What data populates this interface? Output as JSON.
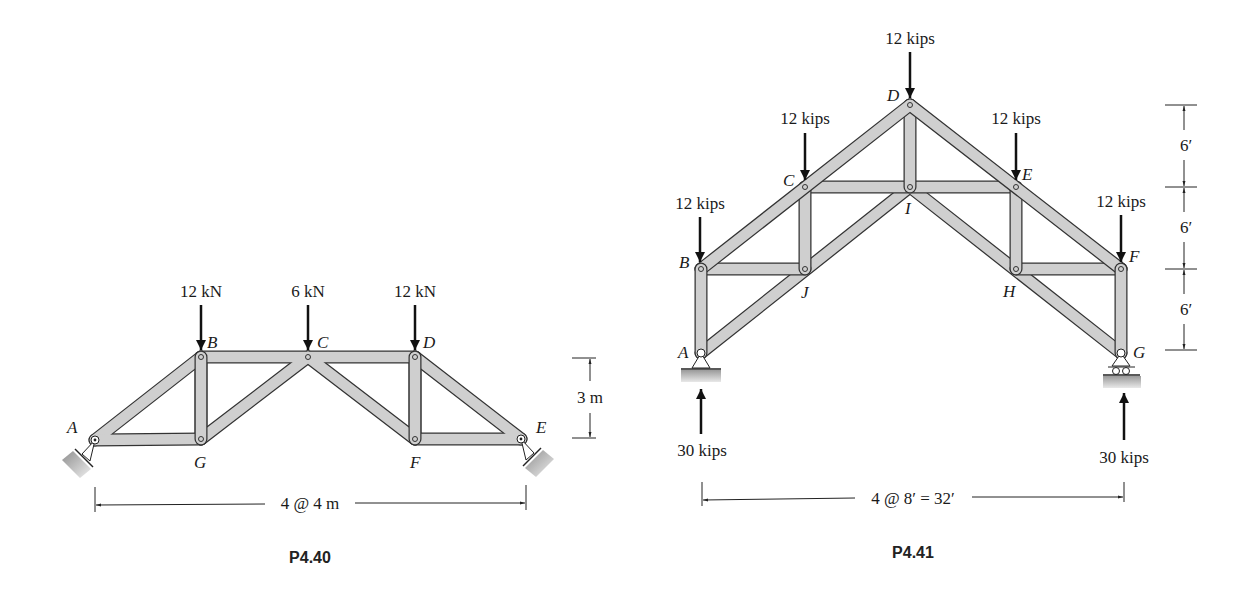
{
  "figures": [
    {
      "id": "p4-40",
      "caption": "P4.40",
      "nodes": {
        "A": {
          "label": "A",
          "x": 95,
          "y": 440
        },
        "G": {
          "label": "G",
          "x": 201,
          "y": 439
        },
        "B": {
          "label": "B",
          "x": 201,
          "y": 357
        },
        "C": {
          "label": "C",
          "x": 308,
          "y": 357
        },
        "D": {
          "label": "D",
          "x": 415,
          "y": 357
        },
        "F": {
          "label": "F",
          "x": 415,
          "y": 439
        },
        "E": {
          "label": "E",
          "x": 521,
          "y": 439
        }
      },
      "members": [
        [
          "A",
          "B"
        ],
        [
          "A",
          "G"
        ],
        [
          "G",
          "B"
        ],
        [
          "B",
          "C"
        ],
        [
          "G",
          "C"
        ],
        [
          "C",
          "D"
        ],
        [
          "C",
          "F"
        ],
        [
          "D",
          "F"
        ],
        [
          "F",
          "E"
        ],
        [
          "D",
          "E"
        ]
      ],
      "loads": [
        {
          "node": "B",
          "label": "12 kN"
        },
        {
          "node": "C",
          "label": "6 kN"
        },
        {
          "node": "D",
          "label": "12 kN"
        }
      ],
      "dimensions": {
        "height": "3 m",
        "span": "4 @ 4 m"
      },
      "supports": {
        "A": "pin",
        "E": "pin"
      }
    },
    {
      "id": "p4-41",
      "caption": "P4.41",
      "nodes": {
        "A": {
          "label": "A",
          "x": 701,
          "y": 353
        },
        "B": {
          "label": "B",
          "x": 701,
          "y": 269
        },
        "C": {
          "label": "C",
          "x": 805,
          "y": 187
        },
        "D": {
          "label": "D",
          "x": 910,
          "y": 105
        },
        "E": {
          "label": "E",
          "x": 1016,
          "y": 187
        },
        "F": {
          "label": "F",
          "x": 1121,
          "y": 269
        },
        "G": {
          "label": "G",
          "x": 1121,
          "y": 353
        },
        "I": {
          "label": "I",
          "x": 910,
          "y": 187
        },
        "J": {
          "label": "J",
          "x": 805,
          "y": 269
        },
        "H": {
          "label": "H",
          "x": 1016,
          "y": 269
        }
      },
      "members": [
        [
          "A",
          "B"
        ],
        [
          "B",
          "C"
        ],
        [
          "C",
          "D"
        ],
        [
          "D",
          "E"
        ],
        [
          "E",
          "F"
        ],
        [
          "F",
          "G"
        ],
        [
          "A",
          "J"
        ],
        [
          "J",
          "I"
        ],
        [
          "I",
          "H"
        ],
        [
          "H",
          "G"
        ],
        [
          "B",
          "J"
        ],
        [
          "C",
          "J"
        ],
        [
          "C",
          "I"
        ],
        [
          "D",
          "I"
        ],
        [
          "I",
          "E"
        ],
        [
          "E",
          "H"
        ],
        [
          "H",
          "F"
        ]
      ],
      "loads": [
        {
          "node": "B",
          "label": "12 kips"
        },
        {
          "node": "C",
          "label": "12 kips"
        },
        {
          "node": "D",
          "label": "12 kips"
        },
        {
          "node": "E",
          "label": "12 kips"
        },
        {
          "node": "F",
          "label": "12 kips"
        }
      ],
      "reactions": [
        {
          "node": "A",
          "label": "30 kips"
        },
        {
          "node": "G",
          "label": "30 kips"
        }
      ],
      "dimensions": {
        "heights": [
          "6′",
          "6′",
          "6′"
        ],
        "span": "4 @ 8′ = 32′"
      },
      "supports": {
        "A": "pin",
        "G": "roller"
      }
    }
  ]
}
